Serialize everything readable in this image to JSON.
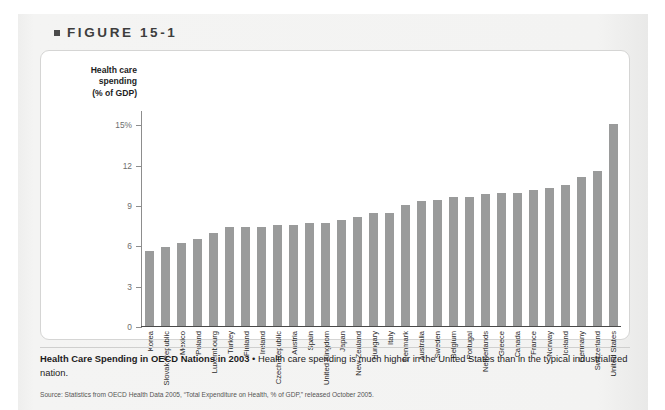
{
  "figure": {
    "bullet_icon": "square-bullet-icon",
    "label": "FIGURE 15-1"
  },
  "chart_data": {
    "type": "bar",
    "title": "Health Care Spending in OECD Nations in 2003",
    "xlabel": "",
    "ylabel": "Health care spending (% of GDP)",
    "ylabel_lines": [
      "Health care",
      "spending",
      "(% of GDP)"
    ],
    "ylim": [
      0,
      16
    ],
    "yticks": [
      0,
      3,
      6,
      9,
      12,
      15
    ],
    "ytick_labels": [
      "0",
      "3",
      "6",
      "9",
      "12",
      "15%"
    ],
    "grid": false,
    "legend": null,
    "bar_color": "#9a9b9b",
    "categories": [
      "Korea",
      "Slovak Republic",
      "Mexico",
      "Poland",
      "Luxembourg",
      "Turkey",
      "Finland",
      "Ireland",
      "Czech Republic",
      "Austria",
      "Spain",
      "United Kingdom",
      "Japan",
      "New Zealand",
      "Hungary",
      "Italy",
      "Denmark",
      "Australia",
      "Sweden",
      "Belgium",
      "Portugal",
      "Netherlands",
      "Greece",
      "Canada",
      "France",
      "Norway",
      "Iceland",
      "Germany",
      "Switzerland",
      "United States"
    ],
    "values": [
      5.6,
      5.9,
      6.2,
      6.5,
      6.9,
      7.4,
      7.4,
      7.4,
      7.5,
      7.5,
      7.7,
      7.7,
      7.9,
      8.1,
      8.4,
      8.4,
      9.0,
      9.3,
      9.4,
      9.6,
      9.6,
      9.8,
      9.9,
      9.9,
      10.1,
      10.3,
      10.5,
      11.1,
      11.5,
      15.0
    ],
    "value_unit": "% of GDP"
  },
  "caption": {
    "headline": "Health Care Spending in OECD Nations in 2003",
    "separator": "•",
    "body": "Health care spending is much higher in the United States than in the typical industrialized nation."
  },
  "source": {
    "text": "Source: Statistics from OECD Health Data 2005, “Total Expenditure on Health, % of GDP,” released October 2005."
  }
}
